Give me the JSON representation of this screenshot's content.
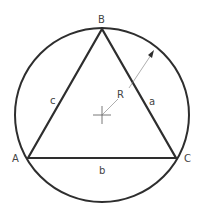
{
  "diagram": {
    "colors": {
      "stroke": "#2e2e2e",
      "thin": "#555555",
      "text": "#444444",
      "background": "#ffffff"
    },
    "circle": {
      "cx": 102,
      "cy": 115,
      "r": 87
    },
    "vertices": {
      "A": {
        "label": "A",
        "x": 28,
        "y": 158
      },
      "B": {
        "label": "B",
        "x": 102,
        "y": 29
      },
      "C": {
        "label": "C",
        "x": 176,
        "y": 158
      }
    },
    "sides": {
      "a": {
        "label": "a"
      },
      "b": {
        "label": "b"
      },
      "c": {
        "label": "c"
      }
    },
    "radius": {
      "label": "R"
    },
    "center_mark": "crosshair"
  }
}
